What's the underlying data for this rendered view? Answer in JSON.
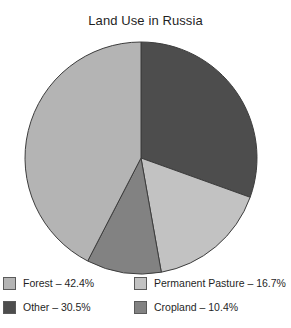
{
  "chart_data": {
    "type": "pie",
    "title": "Land Use in Russia",
    "xlabel": "",
    "ylabel": "",
    "legend_position": "bottom",
    "grid": false,
    "start_angle_deg": 0,
    "direction": "clockwise",
    "units": "percent",
    "categories": [
      "Forest",
      "Other",
      "Permanent Pasture",
      "Cropland"
    ],
    "values": [
      42.4,
      30.5,
      16.7,
      10.4
    ],
    "slices": [
      {
        "label": "Other",
        "value": 30.5,
        "value_text": "30.5%",
        "color": "#4d4d4d"
      },
      {
        "label": "Permanent Pasture",
        "value": 16.7,
        "value_text": "16.7%",
        "color": "#c2c2c2"
      },
      {
        "label": "Cropland",
        "value": 10.4,
        "value_text": "10.4%",
        "color": "#828282"
      },
      {
        "label": "Forest",
        "value": 42.4,
        "value_text": "42.4%",
        "color": "#b4b4b4"
      }
    ],
    "geometry": {
      "cx": 141,
      "cy": 158,
      "r": 116
    },
    "stroke_color": "#3d3d3d"
  },
  "legend": {
    "items": [
      {
        "label": "Forest",
        "value_text": "42.4%",
        "text": "Forest – 42.4%",
        "color": "#b4b4b4"
      },
      {
        "label": "Permanent Pasture",
        "value_text": "16.7%",
        "text": "Permanent Pasture – 16.7%",
        "color": "#c2c2c2"
      },
      {
        "label": "Other",
        "value_text": "30.5%",
        "text": "Other – 30.5%",
        "color": "#4d4d4d"
      },
      {
        "label": "Cropland",
        "value_text": "10.4%",
        "text": "Cropland – 10.4%",
        "color": "#828282"
      }
    ]
  }
}
